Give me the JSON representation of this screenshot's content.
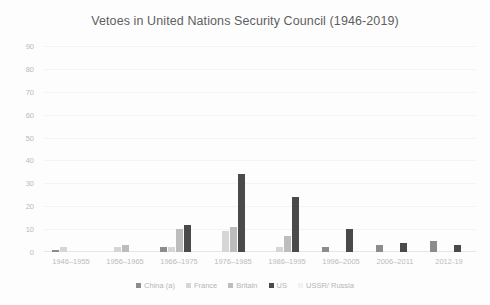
{
  "chart_data": {
    "type": "bar",
    "title": "Vetoes in United Nations Security Council (1946-2019)",
    "xlabel": "",
    "ylabel": "",
    "ylim": [
      0,
      90
    ],
    "yticks": [
      0,
      10,
      20,
      30,
      40,
      50,
      60,
      70,
      80,
      90
    ],
    "grid": true,
    "legend_position": "bottom",
    "categories": [
      "1946–1955",
      "1956–1965",
      "1966–1975",
      "1976–1985",
      "1986–1995",
      "1996–2005",
      "2006–2011",
      "2012-19"
    ],
    "series": [
      {
        "name": "China (a)",
        "color": "#8c8c8c",
        "values": [
          1,
          0,
          2,
          0,
          0,
          2,
          3,
          5
        ]
      },
      {
        "name": "France",
        "color": "#d6d6d6",
        "values": [
          2,
          2,
          2,
          9,
          2,
          0,
          0,
          0
        ]
      },
      {
        "name": "Britain",
        "color": "#bdbdbd",
        "values": [
          0,
          3,
          10,
          11,
          7,
          0,
          0,
          0
        ]
      },
      {
        "name": "US",
        "color": "#4a4a4a",
        "values": [
          0,
          0,
          12,
          34,
          24,
          10,
          4,
          3
        ]
      },
      {
        "name": "USSR/ Russia",
        "color": "#f2f2f2",
        "values": [
          0,
          0,
          0,
          0,
          0,
          0,
          0,
          0
        ]
      }
    ]
  },
  "legend": {
    "items": [
      {
        "label": "China (a)"
      },
      {
        "label": "France"
      },
      {
        "label": "Britain"
      },
      {
        "label": "US"
      },
      {
        "label": "USSR/ Russia"
      }
    ]
  }
}
